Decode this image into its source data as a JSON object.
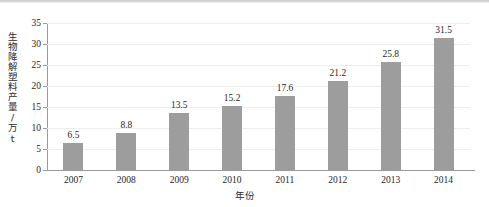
{
  "chart_data": {
    "type": "bar",
    "title": "",
    "xlabel": "年份",
    "ylabel": "生物降解塑料产量/万t",
    "categories": [
      "2007",
      "2008",
      "2009",
      "2010",
      "2011",
      "2012",
      "2013",
      "2014"
    ],
    "values": [
      6.5,
      8.8,
      13.5,
      15.2,
      17.6,
      21.2,
      25.8,
      31.5
    ],
    "value_labels": [
      "6.5",
      "8.8",
      "13.5",
      "15.2",
      "17.6",
      "21.2",
      "25.8",
      "31.5"
    ],
    "ylim": [
      0,
      35
    ],
    "yticks": [
      0,
      5,
      10,
      15,
      20,
      25,
      30,
      35
    ],
    "ytick_labels": [
      "0",
      "5",
      "10",
      "15",
      "20",
      "25",
      "30",
      "35"
    ],
    "grid": true,
    "legend": "none",
    "series": [
      {
        "name": "生物降解塑料产量",
        "values": [
          6.5,
          8.8,
          13.5,
          15.2,
          17.6,
          21.2,
          25.8,
          31.5
        ]
      }
    ],
    "colors": {
      "bar": "#9d9d9d",
      "axis": "#9a9a9a",
      "gridline": "#eceef0",
      "text": "#1f1f1f",
      "background": "#ffffff"
    }
  }
}
